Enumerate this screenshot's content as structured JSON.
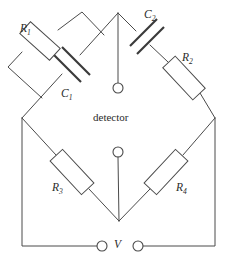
{
  "diagram": {
    "type": "circuit-schematic",
    "stroke_color": "#4a4a4a",
    "background_color": "#ffffff",
    "labels": {
      "r1": {
        "symbol": "R",
        "subscript": "1"
      },
      "r2": {
        "symbol": "R",
        "subscript": "2"
      },
      "r3": {
        "symbol": "R",
        "subscript": "3"
      },
      "r4": {
        "symbol": "R",
        "subscript": "4"
      },
      "c1": {
        "symbol": "C",
        "subscript": "1"
      },
      "c2": {
        "symbol": "C",
        "subscript": "2"
      },
      "detector": "detector",
      "source": "V"
    },
    "components": [
      {
        "id": "r1",
        "kind": "resistor",
        "label": "R1",
        "arm": "upper-left-parallel-branch"
      },
      {
        "id": "c1",
        "kind": "capacitor",
        "label": "C1",
        "arm": "upper-left-main-diagonal"
      },
      {
        "id": "c2",
        "kind": "capacitor",
        "label": "C2",
        "arm": "upper-right"
      },
      {
        "id": "r2",
        "kind": "resistor",
        "label": "R2",
        "arm": "upper-right"
      },
      {
        "id": "r3",
        "kind": "resistor",
        "label": "R3",
        "arm": "lower-left"
      },
      {
        "id": "r4",
        "kind": "resistor",
        "label": "R4",
        "arm": "lower-right"
      },
      {
        "id": "detector",
        "kind": "terminal-pair",
        "label": "detector",
        "arm": "vertical-diagonal"
      },
      {
        "id": "source",
        "kind": "terminal-pair",
        "label": "V",
        "arm": "outer-bottom"
      }
    ],
    "nodes": [
      {
        "id": "top",
        "x": 118,
        "y": 13
      },
      {
        "id": "left",
        "x": 22,
        "y": 118
      },
      {
        "id": "right",
        "x": 215,
        "y": 118
      },
      {
        "id": "bottom",
        "x": 119,
        "y": 221
      }
    ]
  }
}
